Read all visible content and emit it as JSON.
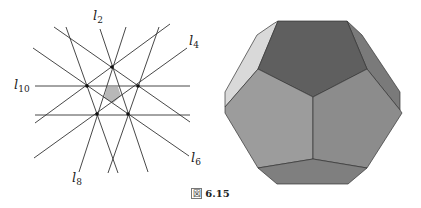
{
  "caption": {
    "prefix": "図",
    "number": "6.15"
  },
  "left_diagram": {
    "description": "Arrangement of 10 lines through 5 points forming a central shaded pentagon",
    "labels": [
      {
        "id": "l2",
        "base": "l",
        "sub": "2"
      },
      {
        "id": "l4",
        "base": "l",
        "sub": "4"
      },
      {
        "id": "l6",
        "base": "l",
        "sub": "6"
      },
      {
        "id": "l8",
        "base": "l",
        "sub": "8"
      },
      {
        "id": "l10",
        "base": "l",
        "sub": "10"
      }
    ],
    "points": 5,
    "lines": 10,
    "shaded_region_color": "#b8b8b8",
    "line_color": "#333333"
  },
  "right_diagram": {
    "description": "Shaded polyhedron (truncated dodecahedral shape) with pentagonal faces",
    "face_colors": {
      "top": "#5f5f5f",
      "left": "#9c9c9c",
      "right": "#8c8c8c",
      "bottom": "#7f7f7f",
      "left_bevel": "#d9d9d9",
      "right_bevel": "#7a7a7a"
    }
  }
}
